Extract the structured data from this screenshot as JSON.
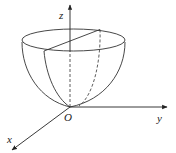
{
  "figure": {
    "axes": {
      "z": {
        "label": "z"
      },
      "y": {
        "label": "y"
      },
      "x": {
        "label": "x"
      },
      "origin": {
        "label": "O"
      }
    },
    "colors": {
      "stroke": "#333333",
      "background": "#ffffff"
    }
  }
}
